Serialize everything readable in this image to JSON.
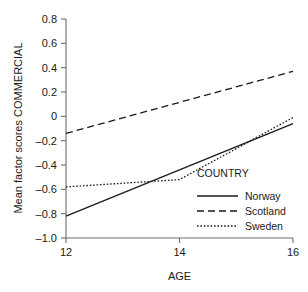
{
  "chart_data": {
    "type": "line",
    "title": "",
    "xlabel": "AGE",
    "ylabel": "Mean factor scores COMMERCIAL",
    "xlim": [
      12,
      16
    ],
    "ylim": [
      -1.0,
      0.8
    ],
    "xticks": [
      "12",
      "14",
      "16"
    ],
    "xtick_values": [
      12,
      14,
      16
    ],
    "yticks": [
      "0.8",
      "0.6",
      "0.4",
      "0.2",
      "0",
      "–0.2",
      "–0.4",
      "–0.6",
      "–0.8",
      "–1.0"
    ],
    "ytick_values": [
      0.8,
      0.6,
      0.4,
      0.2,
      0,
      -0.2,
      -0.4,
      -0.6,
      -0.8,
      -1.0
    ],
    "grid": false,
    "legend_position": "inside-lower-right",
    "legend_title": "COUNTRY",
    "x": [
      12,
      14,
      16
    ],
    "series": [
      {
        "name": "Norway",
        "values": [
          -0.82,
          -0.44,
          -0.06
        ],
        "style": "solid",
        "color": "#1a1a1a"
      },
      {
        "name": "Scotland",
        "values": [
          -0.14,
          0.115,
          0.37
        ],
        "style": "dashed",
        "color": "#1a1a1a"
      },
      {
        "name": "Sweden",
        "values": [
          -0.58,
          -0.52,
          -0.01
        ],
        "style": "dotted",
        "color": "#1a1a1a"
      }
    ]
  },
  "axes": {
    "y_title": "Mean factor scores COMMERCIAL",
    "x_title": "AGE",
    "y_labels": [
      "0.8",
      "0.6",
      "0.4",
      "0.2",
      "0",
      "–0.2",
      "–0.4",
      "–0.6",
      "–0.8",
      "–1.0"
    ],
    "x_labels": [
      "12",
      "14",
      "16"
    ]
  },
  "legend": {
    "title": "COUNTRY",
    "entries": [
      {
        "label": "Norway",
        "style": "solid"
      },
      {
        "label": "Scotland",
        "style": "dashed"
      },
      {
        "label": "Sweden",
        "style": "dotted"
      }
    ]
  }
}
